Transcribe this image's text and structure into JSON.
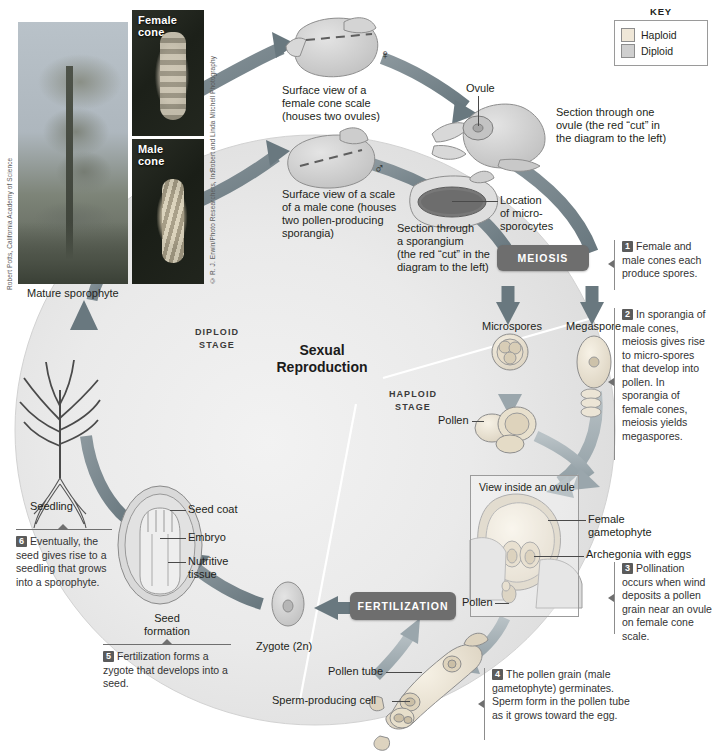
{
  "figure": {
    "center_title_line1": "Sexual",
    "center_title_line2": "Reproduction",
    "diploid_stage_line1": "DIPLOID",
    "diploid_stage_line2": "STAGE",
    "haploid_stage_line1": "HAPLOID",
    "haploid_stage_line2": "STAGE"
  },
  "key": {
    "title": "KEY",
    "items": [
      {
        "label": "Haploid",
        "color": "#efe7d8"
      },
      {
        "label": "Diploid",
        "color": "#cfcfcf"
      }
    ]
  },
  "photos": [
    {
      "name": "mature-sporophyte-photo",
      "caption": "",
      "credit": "Robert Potts, California Academy of Science"
    },
    {
      "name": "female-cone-photo",
      "caption_line1": "Female",
      "caption_line2": "cone",
      "credit": "Robert and Linda Mitchell Photography"
    },
    {
      "name": "male-cone-photo",
      "caption_line1": "Male",
      "caption_line2": "cone",
      "credit": "© R. J. Erwin/Photo Researchers, Inc."
    }
  ],
  "labels": {
    "mature_sporophyte": "Mature sporophyte",
    "seedling": "Seedling",
    "female_cone_scale": "Surface view of a\nfemale cone scale\n(houses two ovules)",
    "male_cone_scale": "Surface view of a scale\nof a male cone (houses\ntwo pollen-producing\nsporangia)",
    "ovule": "Ovule",
    "section_ovule": "Section through one\novule (the red “cut” in\nthe diagram to the left)",
    "section_sporangium": "Section through\na sporangium\n(the red “cut” in the\ndiagram to the left)",
    "location_microsporocytes": "Location\nof micro-\nsporocytes",
    "microspores": "Microspores",
    "megaspore": "Megaspore",
    "pollen_upper": "Pollen",
    "pollen_lower": "Pollen",
    "pollen_inside_ovule": "Pollen",
    "view_inside_ovule": "View inside an ovule",
    "female_gametophyte": "Female\ngametophyte",
    "archegonia_with_eggs": "Archegonia with eggs",
    "pollen_tube": "Pollen tube",
    "sperm_producing_cell": "Sperm-producing cell",
    "zygote": "Zygote (2n)",
    "seed_formation": "Seed\nformation",
    "seed_coat": "Seed coat",
    "embryo": "Embryo",
    "nutritive_tissue": "Nutritive\ntissue"
  },
  "process_boxes": [
    {
      "name": "meiosis-box",
      "label": "MEIOSIS"
    },
    {
      "name": "fertilization-box",
      "label": "FERTILIZATION"
    }
  ],
  "steps": [
    {
      "num": "1",
      "text": "Female and male cones each produce spores."
    },
    {
      "num": "2",
      "text": "In sporangia of male cones, meiosis gives rise to micro-spores that develop into pollen. In sporangia of female cones, meiosis yields megaspores."
    },
    {
      "num": "3",
      "text": "Pollination occurs when wind deposits a pollen grain near an ovule on female cone scale."
    },
    {
      "num": "4",
      "text": "The pollen grain (male gametophyte) germinates. Sperm form in the pollen tube as it grows toward the egg."
    },
    {
      "num": "5",
      "text": "Fertilization forms a zygote that develops into a seed."
    },
    {
      "num": "6",
      "text": "Eventually, the seed gives rise to a seedling that grows into a sporophyte."
    }
  ],
  "symbols": {
    "female": "♀",
    "male": "♂"
  },
  "colors": {
    "arrow_dark": "#6f7e86",
    "arrow_light": "#aeb8bd",
    "haploid_fill": "#efe7d8",
    "diploid_fill": "#cfcfcf",
    "box_gray": "#6e6e6e",
    "text": "#231f20"
  }
}
